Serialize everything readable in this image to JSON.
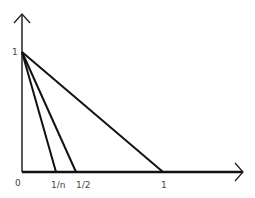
{
  "diagram": {
    "title": "",
    "y_label_top": "1",
    "x_labels": {
      "origin": "0",
      "one_over_n": "1/n",
      "half": "1/2",
      "one": "1"
    },
    "lines": [
      {
        "from": [
          0,
          1
        ],
        "to": [
          "1/n",
          0
        ]
      },
      {
        "from": [
          0,
          1
        ],
        "to": [
          "1/2",
          0
        ]
      },
      {
        "from": [
          0,
          1
        ],
        "to": [
          1,
          0
        ]
      }
    ]
  }
}
